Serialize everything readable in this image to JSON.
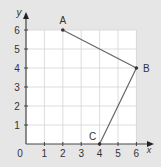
{
  "chart_data": {
    "type": "line",
    "title": "",
    "xlabel": "x",
    "ylabel": "y",
    "xlim": [
      0,
      6
    ],
    "ylim": [
      0,
      6
    ],
    "grid": true,
    "x_ticks": [
      "1",
      "2",
      "3",
      "4",
      "5",
      "6"
    ],
    "y_ticks": [
      "1",
      "2",
      "3",
      "4",
      "5",
      "6"
    ],
    "origin_label": "0",
    "series": [
      {
        "name": "A-B-C",
        "points": [
          {
            "label": "A",
            "x": 2,
            "y": 6
          },
          {
            "label": "B",
            "x": 6,
            "y": 4
          },
          {
            "label": "C",
            "x": 4,
            "y": 0
          }
        ]
      }
    ]
  },
  "colors": {
    "background": "#e6e6e6",
    "plot_area": "#ffffff",
    "grid": "#d4d4d4",
    "axis": "#444444",
    "line": "#666666",
    "point": "#333333"
  }
}
